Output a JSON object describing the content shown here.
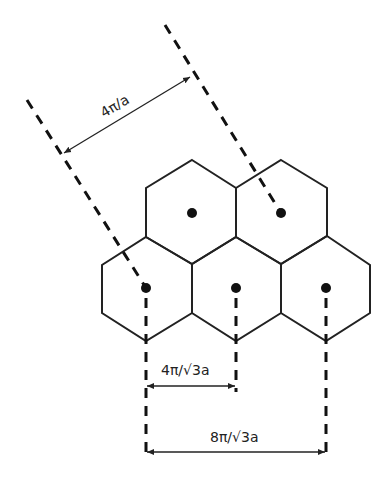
{
  "diagram": {
    "type": "reciprocal lattice hexagonal Brillouin zones",
    "labels": {
      "diagonal_spacing": "4π/a",
      "short_spacing": "4π/√3a",
      "long_spacing": "8π/√3a"
    },
    "hexagon_count": 5,
    "lattice_point_count": 5
  }
}
